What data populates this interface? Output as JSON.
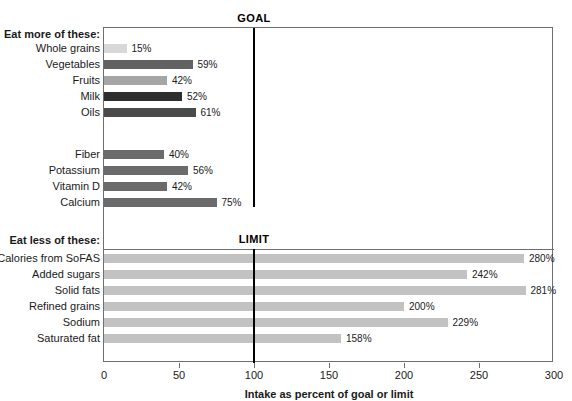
{
  "chart_data": {
    "type": "bar",
    "orientation": "horizontal",
    "title": "",
    "xlabel": "Intake as percent of goal or limit",
    "ylabel": "",
    "xlim": [
      0,
      300
    ],
    "xticks": [
      0,
      50,
      100,
      150,
      200,
      250,
      300
    ],
    "xtick_labels": [
      "0",
      "50",
      "100",
      "150",
      "200",
      "250",
      "300"
    ],
    "grid": false,
    "legend": "none",
    "reference_lines": [
      {
        "label": "GOAL",
        "value": 100
      },
      {
        "label": "LIMIT",
        "value": 100
      }
    ],
    "groups": [
      {
        "heading": "Eat more of these:",
        "reference": "GOAL",
        "categories": [
          "Whole grains",
          "Vegetables",
          "Fruits",
          "Milk",
          "Oils"
        ],
        "values": [
          15,
          59,
          42,
          52,
          61
        ],
        "value_labels": [
          "15%",
          "59%",
          "42%",
          "52%",
          "61%"
        ],
        "colors": [
          "#d8d8d8",
          "#616161",
          "#a6a6a6",
          "#2e2e2e",
          "#4a4a4a"
        ]
      },
      {
        "heading": "",
        "reference": "GOAL",
        "categories": [
          "Fiber",
          "Potassium",
          "Vitamin D",
          "Calcium"
        ],
        "values": [
          40,
          56,
          42,
          75
        ],
        "value_labels": [
          "40%",
          "56%",
          "42%",
          "75%"
        ],
        "colors": [
          "#6b6b6b",
          "#6b6b6b",
          "#6b6b6b",
          "#6b6b6b"
        ]
      },
      {
        "heading": "Eat less of these:",
        "reference": "LIMIT",
        "categories": [
          "Calories from SoFAS",
          "Added sugars",
          "Solid fats",
          "Refined grains",
          "Sodium",
          "Saturated fat"
        ],
        "values": [
          280,
          242,
          281,
          200,
          229,
          158
        ],
        "value_labels": [
          "280%",
          "242%",
          "281%",
          "200%",
          "229%",
          "158%"
        ],
        "colors": [
          "#c2c2c2",
          "#c2c2c2",
          "#c2c2c2",
          "#c2c2c2",
          "#c2c2c2",
          "#c2c2c2"
        ]
      }
    ]
  },
  "colors": {
    "axis": "#6f6f6f",
    "reference_line": "#000000",
    "text": "#1a1a1a",
    "background": "#ffffff"
  }
}
